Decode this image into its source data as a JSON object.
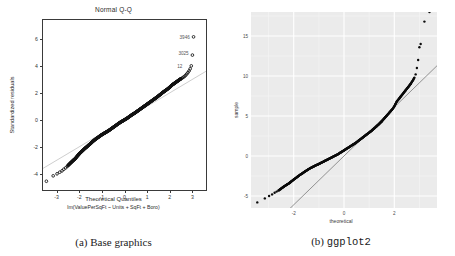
{
  "figure": {
    "panels": [
      {
        "id": "base-graphics",
        "caption": "(a) Base graphics",
        "caption_prefix": "(a)",
        "caption_text": "Base graphics",
        "title": "Normal Q-Q",
        "xlabel": "Theoretical Quantiles",
        "sublabel": "lm(ValuePerSqFt ~ Units + SqFt + Boro)",
        "ylabel": "Standardized residuals",
        "xticks": [
          "-3",
          "-2",
          "-1",
          "0",
          "1",
          "2",
          "3"
        ],
        "yticks": [
          "6",
          "4",
          "2",
          "0",
          "-2",
          "-4"
        ],
        "outlier_labels": [
          "3946",
          "3025",
          "12"
        ]
      },
      {
        "id": "ggplot2",
        "caption": "(b) ggplot2",
        "caption_prefix": "(b)",
        "caption_text": "ggplot2",
        "title": "",
        "xlabel": "theoretical",
        "ylabel": "sample",
        "xticks": [
          "-2",
          "0",
          "2"
        ],
        "yticks": [
          "-5",
          "0",
          "5",
          "10",
          "15"
        ]
      }
    ]
  },
  "chart_data": [
    {
      "type": "scatter",
      "id": "base-graphics",
      "title": "Normal Q-Q",
      "xlabel": "Theoretical Quantiles",
      "sublabel": "lm(ValuePerSqFt ~ Units + SqFt + Boro)",
      "ylabel": "Standardized residuals",
      "xlim": [
        -3.6,
        3.6
      ],
      "ylim": [
        -5.2,
        7.4
      ],
      "xticks": [
        -3,
        -2,
        -1,
        0,
        1,
        2,
        3
      ],
      "yticks": [
        6,
        4,
        2,
        0,
        -2,
        -4
      ],
      "grid": false,
      "legend": "none",
      "reference_line": {
        "type": "qqline",
        "slope": 1.0,
        "intercept": 0.0,
        "color": "#b9b9b9"
      },
      "annotations": [
        {
          "label": "3946",
          "x": 3.05,
          "y": 6.1
        },
        {
          "label": "3025",
          "x": 3.0,
          "y": 4.85
        },
        {
          "label": "12",
          "x": 2.95,
          "y": 3.95
        }
      ],
      "x": [
        -3.45,
        -3.15,
        -2.98,
        -2.86,
        -2.76,
        -2.68,
        -2.6,
        -2.53,
        -2.47,
        -2.41,
        -2.36,
        -2.31,
        -2.26,
        -2.22,
        -2.18,
        -2.14,
        -2.1,
        -2.06,
        -2.02,
        -1.99,
        -1.95,
        -1.9,
        -1.85,
        -1.8,
        -1.75,
        -1.7,
        -1.65,
        -1.6,
        -1.55,
        -1.5,
        -1.45,
        -1.4,
        -1.35,
        -1.3,
        -1.25,
        -1.2,
        -1.15,
        -1.1,
        -1.05,
        -1.0,
        -0.95,
        -0.9,
        -0.85,
        -0.8,
        -0.75,
        -0.7,
        -0.65,
        -0.6,
        -0.55,
        -0.5,
        -0.45,
        -0.4,
        -0.35,
        -0.3,
        -0.25,
        -0.2,
        -0.15,
        -0.1,
        -0.05,
        0.0,
        0.05,
        0.1,
        0.15,
        0.2,
        0.25,
        0.3,
        0.35,
        0.4,
        0.45,
        0.5,
        0.55,
        0.6,
        0.65,
        0.7,
        0.75,
        0.8,
        0.85,
        0.9,
        0.95,
        1.0,
        1.05,
        1.1,
        1.15,
        1.2,
        1.25,
        1.3,
        1.35,
        1.4,
        1.45,
        1.5,
        1.55,
        1.6,
        1.65,
        1.7,
        1.75,
        1.8,
        1.85,
        1.9,
        1.95,
        2.0,
        2.05,
        2.1,
        2.15,
        2.2,
        2.25,
        2.3,
        2.35,
        2.4,
        2.45,
        2.5,
        2.55,
        2.6,
        2.65,
        2.7,
        2.75,
        2.8,
        2.85,
        2.9,
        2.95,
        3.0,
        3.05
      ],
      "y": [
        -4.55,
        -4.15,
        -4.0,
        -3.88,
        -3.78,
        -3.66,
        -3.56,
        -3.45,
        -3.34,
        -3.24,
        -3.16,
        -3.08,
        -3.0,
        -2.94,
        -2.88,
        -2.8,
        -2.72,
        -2.64,
        -2.57,
        -2.5,
        -2.44,
        -2.36,
        -2.28,
        -2.2,
        -2.12,
        -2.05,
        -1.98,
        -1.9,
        -1.83,
        -1.76,
        -1.68,
        -1.6,
        -1.53,
        -1.46,
        -1.4,
        -1.34,
        -1.28,
        -1.22,
        -1.16,
        -1.1,
        -1.05,
        -1.0,
        -0.95,
        -0.9,
        -0.85,
        -0.8,
        -0.74,
        -0.68,
        -0.62,
        -0.56,
        -0.5,
        -0.44,
        -0.38,
        -0.32,
        -0.26,
        -0.2,
        -0.15,
        -0.1,
        -0.05,
        0.0,
        0.05,
        0.1,
        0.16,
        0.22,
        0.28,
        0.34,
        0.4,
        0.45,
        0.5,
        0.56,
        0.62,
        0.68,
        0.74,
        0.8,
        0.86,
        0.92,
        0.98,
        1.04,
        1.1,
        1.16,
        1.22,
        1.28,
        1.34,
        1.4,
        1.46,
        1.52,
        1.58,
        1.64,
        1.7,
        1.77,
        1.84,
        1.9,
        1.97,
        2.04,
        2.1,
        2.16,
        2.22,
        2.28,
        2.35,
        2.42,
        2.5,
        2.58,
        2.64,
        2.7,
        2.76,
        2.82,
        2.88,
        2.94,
        3.0,
        3.05,
        3.1,
        3.16,
        3.22,
        3.3,
        3.4,
        3.5,
        3.62,
        3.78,
        4.0,
        4.8,
        6.15
      ]
    },
    {
      "type": "scatter",
      "id": "ggplot2",
      "title": "",
      "xlabel": "theoretical",
      "ylabel": "sample",
      "xlim": [
        -3.7,
        3.7
      ],
      "ylim": [
        -6.5,
        18.0
      ],
      "xticks": [
        -2,
        0,
        2
      ],
      "yticks": [
        -5,
        0,
        5,
        10,
        15
      ],
      "grid": true,
      "legend": "none",
      "panel_fill": "#ebebeb",
      "gridline_color": "#ffffff",
      "reference_line": {
        "type": "abline",
        "slope": 3.05,
        "intercept": 0.0,
        "color": "#7a7a7a"
      },
      "x": [
        -3.45,
        -3.15,
        -2.98,
        -2.86,
        -2.76,
        -2.68,
        -2.6,
        -2.53,
        -2.47,
        -2.41,
        -2.36,
        -2.31,
        -2.26,
        -2.22,
        -2.18,
        -2.14,
        -2.1,
        -2.06,
        -2.02,
        -1.99,
        -1.95,
        -1.9,
        -1.85,
        -1.8,
        -1.75,
        -1.7,
        -1.65,
        -1.6,
        -1.55,
        -1.5,
        -1.45,
        -1.4,
        -1.35,
        -1.3,
        -1.25,
        -1.2,
        -1.15,
        -1.1,
        -1.05,
        -1.0,
        -0.95,
        -0.9,
        -0.85,
        -0.8,
        -0.75,
        -0.7,
        -0.65,
        -0.6,
        -0.55,
        -0.5,
        -0.45,
        -0.4,
        -0.35,
        -0.3,
        -0.25,
        -0.2,
        -0.15,
        -0.1,
        -0.05,
        0.0,
        0.05,
        0.1,
        0.15,
        0.2,
        0.25,
        0.3,
        0.35,
        0.4,
        0.45,
        0.5,
        0.55,
        0.6,
        0.65,
        0.7,
        0.75,
        0.8,
        0.85,
        0.9,
        0.95,
        1.0,
        1.05,
        1.1,
        1.15,
        1.2,
        1.25,
        1.3,
        1.35,
        1.4,
        1.45,
        1.5,
        1.55,
        1.6,
        1.65,
        1.7,
        1.75,
        1.8,
        1.85,
        1.9,
        1.95,
        2.0,
        2.05,
        2.1,
        2.15,
        2.2,
        2.25,
        2.3,
        2.35,
        2.4,
        2.45,
        2.5,
        2.55,
        2.6,
        2.65,
        2.7,
        2.75,
        2.8,
        2.85,
        2.9,
        2.95,
        3.0,
        3.05,
        3.2,
        3.4
      ],
      "y": [
        -5.8,
        -5.3,
        -5.0,
        -4.8,
        -4.6,
        -4.45,
        -4.3,
        -4.15,
        -4.0,
        -3.88,
        -3.76,
        -3.66,
        -3.56,
        -3.48,
        -3.4,
        -3.3,
        -3.2,
        -3.1,
        -3.0,
        -2.92,
        -2.84,
        -2.72,
        -2.6,
        -2.48,
        -2.36,
        -2.26,
        -2.16,
        -2.04,
        -1.94,
        -1.84,
        -1.74,
        -1.64,
        -1.54,
        -1.46,
        -1.38,
        -1.3,
        -1.22,
        -1.14,
        -1.08,
        -1.0,
        -0.92,
        -0.84,
        -0.76,
        -0.68,
        -0.6,
        -0.52,
        -0.44,
        -0.36,
        -0.28,
        -0.2,
        -0.12,
        -0.04,
        0.04,
        0.12,
        0.2,
        0.3,
        0.4,
        0.5,
        0.6,
        0.7,
        0.8,
        0.9,
        1.0,
        1.1,
        1.2,
        1.3,
        1.4,
        1.5,
        1.6,
        1.72,
        1.84,
        1.96,
        2.08,
        2.2,
        2.32,
        2.44,
        2.56,
        2.68,
        2.8,
        2.92,
        3.04,
        3.16,
        3.3,
        3.44,
        3.58,
        3.72,
        3.86,
        4.0,
        4.16,
        4.32,
        4.5,
        4.68,
        4.86,
        5.04,
        5.22,
        5.4,
        5.58,
        5.76,
        5.95,
        6.2,
        6.5,
        6.8,
        7.0,
        7.2,
        7.4,
        7.6,
        7.8,
        8.0,
        8.2,
        8.4,
        8.6,
        8.8,
        9.0,
        9.25,
        9.5,
        9.8,
        10.2,
        11.0,
        12.0,
        13.6,
        14.0,
        16.8
      ]
    }
  ]
}
